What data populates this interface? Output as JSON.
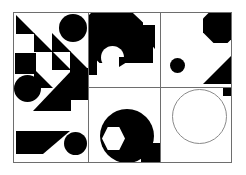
{
  "artwork": {
    "title": "Abstract Geometric Composition",
    "palette": {
      "ink": "#000000",
      "paper": "#ffffff",
      "frame": "#6e6e6e",
      "outline": "#8a8a8a"
    },
    "canvas": {
      "x": 13,
      "y": 12,
      "width": 219,
      "height": 151
    },
    "panels": [
      {
        "name": "top-left",
        "x": 0,
        "y": 0,
        "width": 74,
        "height": 149
      },
      {
        "name": "top-middle",
        "x": 74,
        "y": 0,
        "width": 72,
        "height": 74
      },
      {
        "name": "top-right",
        "x": 146,
        "y": 0,
        "width": 71,
        "height": 74
      },
      {
        "name": "bottom-middle",
        "x": 74,
        "y": 74,
        "width": 72,
        "height": 75
      },
      {
        "name": "bottom-right",
        "x": 146,
        "y": 74,
        "width": 71,
        "height": 75
      }
    ],
    "dividers": {
      "vertical": [
        74,
        146
      ],
      "horizontal": [
        74
      ]
    },
    "shapes": {
      "top_left_panel": [
        {
          "kind": "triangle-bl",
          "fill": "black",
          "x": 2,
          "y": 2,
          "w": 18,
          "h": 18
        },
        {
          "kind": "triangle-bl",
          "fill": "black",
          "x": 20,
          "y": 20,
          "w": 18,
          "h": 18
        },
        {
          "kind": "triangle-bl",
          "fill": "black",
          "x": 38,
          "y": 38,
          "w": 18,
          "h": 18
        },
        {
          "kind": "triangle-bl",
          "fill": "black",
          "x": 20,
          "y": 56,
          "w": 18,
          "h": 18
        },
        {
          "kind": "triangle-bl",
          "fill": "black",
          "x": 38,
          "y": 20,
          "w": 18,
          "h": 18
        },
        {
          "kind": "triangle-bl",
          "fill": "black",
          "x": 56,
          "y": 38,
          "w": 18,
          "h": 18
        },
        {
          "kind": "circle",
          "fill": "black",
          "x": 46,
          "y": 2,
          "w": 27,
          "h": 27
        },
        {
          "kind": "square",
          "fill": "black",
          "x": 2,
          "y": 40,
          "w": 20,
          "h": 20
        },
        {
          "kind": "square",
          "fill": "black",
          "x": 56,
          "y": 56,
          "w": 18,
          "h": 30
        },
        {
          "kind": "circle",
          "fill": "black",
          "x": 1,
          "y": 62,
          "w": 26,
          "h": 26
        },
        {
          "kind": "triangle-br",
          "fill": "black",
          "x": 20,
          "y": 62,
          "w": 36,
          "h": 36
        },
        {
          "kind": "square",
          "fill": "black",
          "x": 2,
          "y": 118,
          "w": 26,
          "h": 22
        },
        {
          "kind": "triangle-tl",
          "fill": "black",
          "x": 28,
          "y": 118,
          "w": 26,
          "h": 22
        },
        {
          "kind": "circle",
          "fill": "black",
          "x": 50,
          "y": 120,
          "w": 22,
          "h": 22
        }
      ],
      "top_middle_panel": [
        {
          "kind": "octagon",
          "fill": "black",
          "x": -6,
          "y": -6,
          "w": 60,
          "h": 56
        },
        {
          "kind": "square",
          "fill": "black",
          "x": 36,
          "y": 18,
          "w": 28,
          "h": 32
        },
        {
          "kind": "triangle-tr",
          "fill": "black",
          "x": 44,
          "y": 14,
          "w": 22,
          "h": 22
        },
        {
          "kind": "circle",
          "fill": "white",
          "x": 14,
          "y": 34,
          "w": 22,
          "h": 22
        },
        {
          "kind": "square",
          "fill": "black",
          "x": -6,
          "y": 40,
          "w": 14,
          "h": 22
        }
      ],
      "top_right_panel": [
        {
          "kind": "octagon",
          "fill": "black",
          "x": 44,
          "y": -4,
          "w": 34,
          "h": 34
        },
        {
          "kind": "circle",
          "fill": "black",
          "x": 10,
          "y": 46,
          "w": 14,
          "h": 14
        },
        {
          "kind": "triangle-br",
          "fill": "black",
          "x": 42,
          "y": 38,
          "w": 32,
          "h": 32
        }
      ],
      "bottom_middle_panel": [
        {
          "kind": "circle",
          "fill": "black",
          "x": 12,
          "y": 22,
          "w": 52,
          "h": 52
        },
        {
          "kind": "hexagon",
          "fill": "white",
          "x": 14,
          "y": 40,
          "w": 22,
          "h": 22
        },
        {
          "kind": "triangle-tr",
          "fill": "black",
          "x": 48,
          "y": 56,
          "w": 26,
          "h": 20
        },
        {
          "kind": "octagon",
          "fill": "black",
          "x": 52,
          "y": 58,
          "w": 24,
          "h": 24
        }
      ],
      "bottom_right_panel": [
        {
          "kind": "ring",
          "fill": "outline",
          "x": 12,
          "y": 2,
          "w": 54,
          "h": 54
        },
        {
          "kind": "square",
          "fill": "black",
          "x": 62,
          "y": -4,
          "w": 14,
          "h": 12
        }
      ]
    }
  }
}
